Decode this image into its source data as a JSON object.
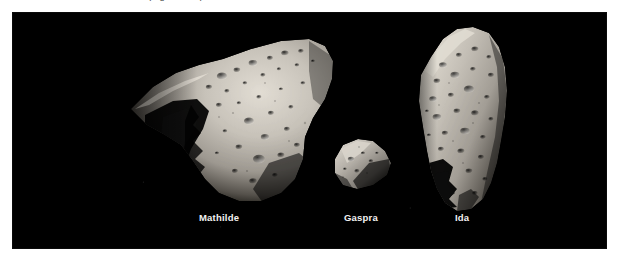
{
  "page": {
    "background_color": "#ffffff",
    "caption_sliver_text": "(Figure 1.11)"
  },
  "panel": {
    "name": "asteroid-comparison-photo",
    "background_color": "#000000",
    "x": 13,
    "y": 13,
    "width": 593,
    "height": 235
  },
  "bodies": [
    {
      "id": "mathilde",
      "label": "Mathilde",
      "label_x": 186,
      "label_y": 199,
      "description": "Large irregular asteroid, brightly lit on the right with a deep shadowed crater basin and jagged terminator on the left; surface pocked with craters.",
      "surface_color": "#cfcac2"
    },
    {
      "id": "gaspra",
      "label": "Gaspra",
      "label_x": 331,
      "label_y": 199,
      "description": "Small elongated wedge-shaped asteroid tilted diagonally, the smallest of the three.",
      "surface_color": "#b9b4ac"
    },
    {
      "id": "ida",
      "label": "Ida",
      "label_x": 442,
      "label_y": 199,
      "description": "Tall elongated heavily cratered asteroid standing vertically, with a deeply shadowed notch along the lower left flank.",
      "surface_color": "#cbc6bd"
    }
  ],
  "label_style": {
    "color": "#f2f2f2",
    "font_size_px": 9.5,
    "weight": "bold"
  }
}
